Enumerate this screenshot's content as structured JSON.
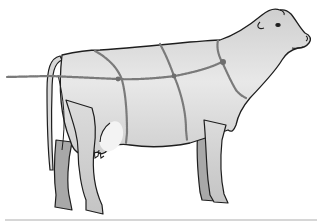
{
  "image": {
    "subject": "cow-with-rope-harness",
    "alt": "Line illustration of a standing cow in profile facing right, with a rope harness tied around its body",
    "colors": {
      "background": "#ffffff",
      "body_fill": "#d4d4d4",
      "body_light": "#e6e6e6",
      "far_legs_fill": "#a9a9a9",
      "outline": "#1e1e1e",
      "rope": "#7a7a7a",
      "ground_line": "#cfcfcf"
    }
  }
}
